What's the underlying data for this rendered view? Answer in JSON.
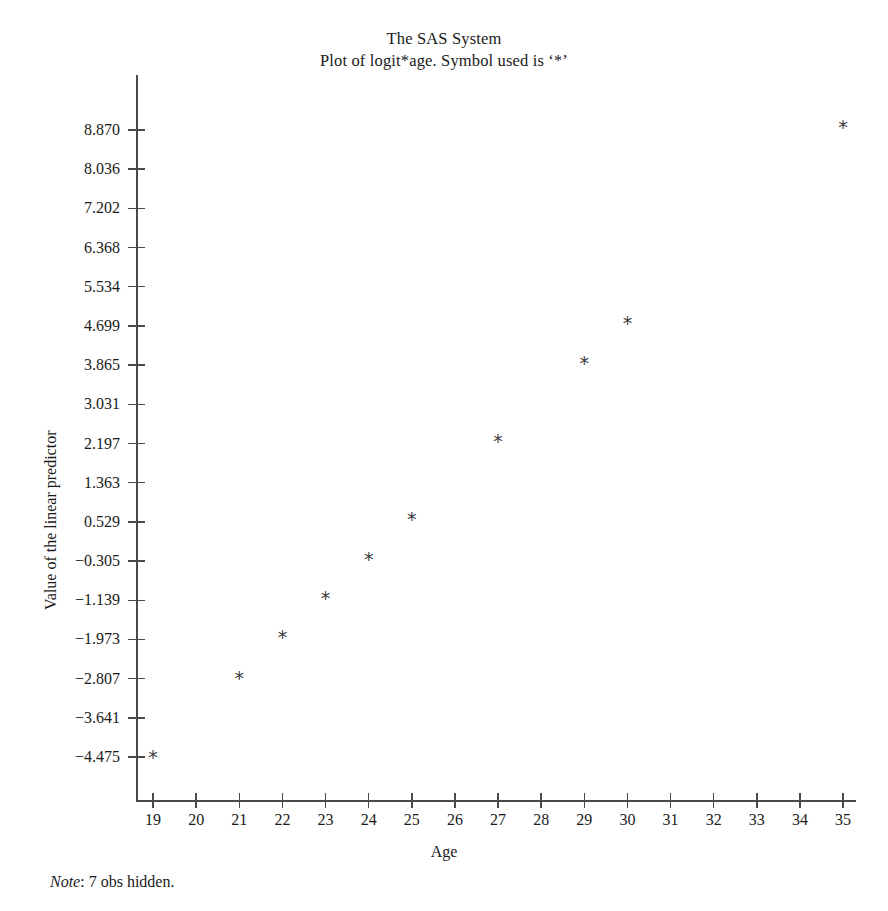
{
  "titles": {
    "line1": "The SAS System",
    "line2": "Plot of logit*age. Symbol used is ‘*’"
  },
  "footnote": {
    "label": "Note",
    "separator": ": ",
    "text": "7 obs hidden."
  },
  "axes": {
    "x_title": "Age",
    "y_title": "Value of the linear predictor"
  },
  "chart_data": {
    "type": "scatter",
    "title": "The SAS System",
    "subtitle": "Plot of logit*age. Symbol used is ‘*’",
    "xlabel": "Age",
    "ylabel": "Value of the linear predictor",
    "marker_symbol": "*",
    "marker_color": "#3c3c3c",
    "axis_color": "#4a4a4a",
    "grid": false,
    "legend": null,
    "xlim": [
      18.6,
      35.4
    ],
    "ylim": [
      -4.9,
      9.3
    ],
    "x_ticks": [
      19,
      20,
      21,
      22,
      23,
      24,
      25,
      26,
      27,
      28,
      29,
      30,
      31,
      32,
      33,
      34,
      35
    ],
    "x_ticklabels": [
      "19",
      "20",
      "21",
      "22",
      "23",
      "24",
      "25",
      "26",
      "27",
      "28",
      "29",
      "30",
      "31",
      "32",
      "33",
      "34",
      "35"
    ],
    "y_ticks": [
      8.87,
      8.036,
      7.202,
      6.368,
      5.534,
      4.699,
      3.865,
      3.031,
      2.197,
      1.363,
      0.529,
      -0.305,
      -1.139,
      -1.973,
      -2.807,
      -3.641,
      -4.475
    ],
    "y_ticklabels": [
      "8.870",
      "8.036",
      "7.202",
      "6.368",
      "5.534",
      "4.699",
      "3.865",
      "3.031",
      "2.197",
      "1.363",
      "0.529",
      "−0.305",
      "−1.139",
      "−1.973",
      "−2.807",
      "−3.641",
      "−4.475"
    ],
    "x": [
      19,
      21,
      22,
      23,
      24,
      25,
      27,
      29,
      30,
      35
    ],
    "y": [
      -4.47,
      -2.79,
      -1.93,
      -1.1,
      -0.26,
      0.58,
      2.25,
      3.92,
      4.77,
      8.93
    ],
    "points": [
      {
        "age": 19,
        "logit": -4.47
      },
      {
        "age": 21,
        "logit": -2.79
      },
      {
        "age": 22,
        "logit": -1.93
      },
      {
        "age": 23,
        "logit": -1.1
      },
      {
        "age": 24,
        "logit": -0.26
      },
      {
        "age": 25,
        "logit": 0.58
      },
      {
        "age": 27,
        "logit": 2.25
      },
      {
        "age": 29,
        "logit": 3.92
      },
      {
        "age": 30,
        "logit": 4.77
      },
      {
        "age": 35,
        "logit": 8.93
      }
    ],
    "annotations": [
      "Note: 7 obs hidden."
    ]
  }
}
